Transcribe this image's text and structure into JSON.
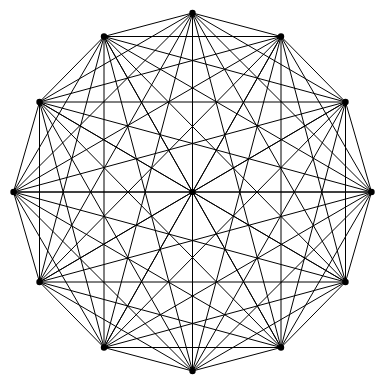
{
  "figure": {
    "kind": "graph-diagram",
    "background_color": "#ffffff",
    "edge_color": "#000000",
    "vertex_color": "#000000",
    "edge_width": 1,
    "vertex_radius": 3.2,
    "canvas": {
      "width": 385,
      "height": 385
    }
  },
  "chart_data": {
    "type": "graph",
    "xlabel": "",
    "ylabel": "",
    "grid": false,
    "legend": "none",
    "layout": "regular 12-gon with one central vertex",
    "vertex_count": 13,
    "edge_count": 78,
    "complete": true,
    "center": {
      "x": 192.5,
      "y": 192.0
    },
    "radius": 179,
    "xlim": [
      0,
      385
    ],
    "ylim": [
      0,
      385
    ],
    "vertices": [
      {
        "id": 0,
        "label": "v0",
        "x": 192.5,
        "y": 13.0,
        "angle_deg": 90,
        "ring": "outer"
      },
      {
        "id": 1,
        "label": "v1",
        "x": 281.0,
        "y": 36.5,
        "angle_deg": 60,
        "ring": "outer"
      },
      {
        "id": 2,
        "label": "v2",
        "x": 345.5,
        "y": 102.0,
        "angle_deg": 30,
        "ring": "outer"
      },
      {
        "id": 3,
        "label": "v3",
        "x": 371.5,
        "y": 192.0,
        "angle_deg": 0,
        "ring": "outer"
      },
      {
        "id": 4,
        "label": "v4",
        "x": 345.5,
        "y": 282.0,
        "angle_deg": 330,
        "ring": "outer"
      },
      {
        "id": 5,
        "label": "v5",
        "x": 281.0,
        "y": 347.5,
        "angle_deg": 300,
        "ring": "outer"
      },
      {
        "id": 6,
        "label": "v6",
        "x": 192.5,
        "y": 371.0,
        "angle_deg": 270,
        "ring": "outer"
      },
      {
        "id": 7,
        "label": "v7",
        "x": 104.0,
        "y": 347.5,
        "angle_deg": 240,
        "ring": "outer"
      },
      {
        "id": 8,
        "label": "v8",
        "x": 39.5,
        "y": 282.0,
        "angle_deg": 210,
        "ring": "outer"
      },
      {
        "id": 9,
        "label": "v9",
        "x": 13.5,
        "y": 192.0,
        "angle_deg": 180,
        "ring": "outer"
      },
      {
        "id": 10,
        "label": "v10",
        "x": 39.5,
        "y": 102.0,
        "angle_deg": 150,
        "ring": "outer"
      },
      {
        "id": 11,
        "label": "v11",
        "x": 104.0,
        "y": 36.5,
        "angle_deg": 120,
        "ring": "outer"
      },
      {
        "id": 12,
        "label": "v12",
        "x": 192.5,
        "y": 192.0,
        "angle_deg": null,
        "ring": "center"
      }
    ],
    "edges_rule": "all-pairs"
  }
}
